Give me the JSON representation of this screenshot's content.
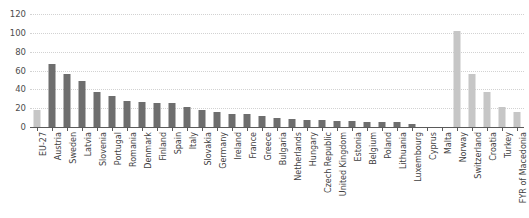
{
  "chart_data": {
    "type": "bar",
    "title": "",
    "subtitle": "",
    "xlabel": "",
    "ylabel": "",
    "ylim": [
      0,
      120
    ],
    "yticks": [
      0,
      20,
      40,
      60,
      80,
      100,
      120
    ],
    "grid": true,
    "legend": "none",
    "categories": [
      "EU-27",
      "Austria",
      "Sweden",
      "Latvia",
      "Slovenia",
      "Portugal",
      "Romania",
      "Denmark",
      "Finland",
      "Spain",
      "Italy",
      "Slovakia",
      "Germany",
      "Ireland",
      "France",
      "Greece",
      "Bulgaria",
      "Netherlands",
      "Hungary",
      "Czech Republic",
      "United Kingdom",
      "Estonia",
      "Belgium",
      "Poland",
      "Lithuania",
      "Luxembourg",
      "Cyprus",
      "Malta",
      "Norway",
      "Switzerland",
      "Croatia",
      "Turkey",
      "FYR of Macedonia"
    ],
    "values": [
      18,
      67,
      56,
      49,
      37,
      33,
      28,
      27,
      26,
      26,
      21,
      18,
      16,
      14,
      14,
      12,
      10,
      9,
      7,
      7,
      6,
      6,
      5,
      5,
      5,
      3,
      0,
      0,
      102,
      56,
      37,
      21,
      16
    ],
    "bar_styles": [
      "light",
      "dark",
      "dark",
      "dark",
      "dark",
      "dark",
      "dark",
      "dark",
      "dark",
      "dark",
      "dark",
      "dark",
      "dark",
      "dark",
      "dark",
      "dark",
      "dark",
      "dark",
      "dark",
      "dark",
      "dark",
      "dark",
      "dark",
      "dark",
      "dark",
      "dark",
      "dark",
      "dark",
      "light",
      "light",
      "light",
      "light",
      "light"
    ],
    "colors": {
      "dark_bar": "#6e6e6e",
      "light_bar": "#c6c6c6",
      "gridline": "#d2d2d2",
      "axis": "#5a5a5a",
      "text": "#4d4d4d",
      "background": "#ffffff"
    }
  }
}
